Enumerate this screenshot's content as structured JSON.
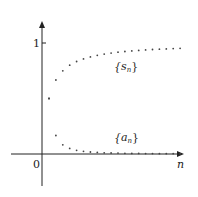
{
  "chart_data": {
    "type": "scatter",
    "title": "",
    "xlabel": "n",
    "ylabel": "",
    "origin_label": "0",
    "y_tick_labels": [
      "1"
    ],
    "y_ticks": [
      1
    ],
    "grid": false,
    "legend": "inline annotations",
    "xlim": [
      0,
      21
    ],
    "ylim": [
      -0.3,
      1.2
    ],
    "x": [
      1,
      2,
      3,
      4,
      5,
      6,
      7,
      8,
      9,
      10,
      11,
      12,
      13,
      14,
      15,
      16,
      17,
      18,
      19,
      20
    ],
    "series": [
      {
        "name": "{s_n}",
        "label_main": "{s",
        "label_sub": "n",
        "label_close": "}",
        "values": [
          0.5,
          0.667,
          0.75,
          0.8,
          0.833,
          0.857,
          0.875,
          0.889,
          0.9,
          0.909,
          0.917,
          0.923,
          0.929,
          0.933,
          0.938,
          0.941,
          0.944,
          0.947,
          0.95,
          0.952
        ]
      },
      {
        "name": "{a_n}",
        "label_main": "{a",
        "label_sub": "n",
        "label_close": "}",
        "values": [
          0.5,
          0.167,
          0.083,
          0.05,
          0.033,
          0.024,
          0.018,
          0.014,
          0.011,
          0.009,
          0.008,
          0.006,
          0.005,
          0.005,
          0.004,
          0.004,
          0.003,
          0.003,
          0.003,
          0.002
        ]
      }
    ],
    "colors": {
      "axis": "#222222",
      "points": "#444444"
    }
  }
}
